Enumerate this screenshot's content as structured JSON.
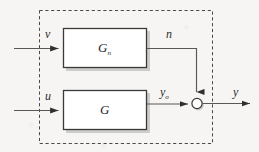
{
  "figure": {
    "type": "block-diagram",
    "background_color": "#f6f5f3",
    "boundary": {
      "name": "system-boundary",
      "style": "dashed",
      "color": "#4a4a4a",
      "x": 39,
      "y": 10,
      "width": 174,
      "height": 134
    }
  },
  "blocks": [
    {
      "id": "block-gn",
      "label": "G",
      "subscript": "n",
      "x": 63,
      "y": 28,
      "width": 84,
      "height": 40,
      "fill": "#ffffff",
      "border_color": "#3a3a3a"
    },
    {
      "id": "block-g",
      "label": "G",
      "subscript": "",
      "x": 63,
      "y": 90,
      "width": 84,
      "height": 40,
      "fill": "#ffffff",
      "border_color": "#3a3a3a"
    }
  ],
  "signals": [
    {
      "id": "input-v",
      "label": "v",
      "subscript": "",
      "x": 45,
      "y": 28
    },
    {
      "id": "input-u",
      "label": "u",
      "subscript": "",
      "x": 45,
      "y": 90
    },
    {
      "id": "noise-n",
      "label": "n",
      "subscript": "",
      "x": 166,
      "y": 28
    },
    {
      "id": "plant-output-y0",
      "label": "y",
      "subscript": "o",
      "x": 160,
      "y": 86
    },
    {
      "id": "output-y",
      "label": "y",
      "subscript": "",
      "x": 233,
      "y": 86
    }
  ],
  "summing_junction": {
    "id": "summing-junction",
    "cx": 197,
    "cy": 103,
    "r": 5,
    "fill": "#ffffff",
    "border_color": "#3a3a3a"
  },
  "connections": [
    {
      "from": "input-v",
      "to": "block-gn",
      "orientation": "horizontal"
    },
    {
      "from": "input-u",
      "to": "block-g",
      "orientation": "horizontal"
    },
    {
      "from": "block-gn",
      "to": "summing-junction",
      "orientation": "right-then-down"
    },
    {
      "from": "block-g",
      "to": "summing-junction",
      "orientation": "horizontal"
    },
    {
      "from": "summing-junction",
      "to": "output-y",
      "orientation": "horizontal"
    }
  ],
  "colors": {
    "line": "#585858",
    "dark_line": "#3a3a3a",
    "dashed": "#4a4a4a",
    "text": "#2b2b2b",
    "shadow": "#9d9d9d"
  }
}
